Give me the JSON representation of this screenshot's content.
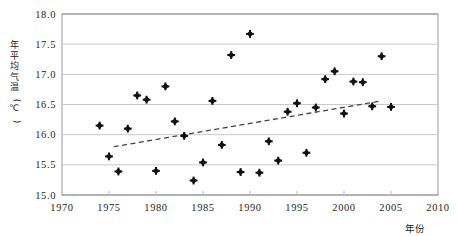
{
  "chart_data": {
    "type": "scatter",
    "title": "",
    "xlabel": "年份",
    "ylabel": "年平均气温(℃)",
    "xlim": [
      1970,
      2010
    ],
    "ylim": [
      15.0,
      18.0
    ],
    "xticks": [
      "1970",
      "1975",
      "1980",
      "1985",
      "1990",
      "1995",
      "2000",
      "2005",
      "2010"
    ],
    "xtick_values": [
      1970,
      1975,
      1980,
      1985,
      1990,
      1995,
      2000,
      2005,
      2010
    ],
    "yticks": [
      "15.0",
      "15.5",
      "16.0",
      "16.5",
      "17.0",
      "17.5",
      "18.0"
    ],
    "ytick_values": [
      15.0,
      15.5,
      16.0,
      16.5,
      17.0,
      17.5,
      18.0
    ],
    "grid": "horizontal",
    "legend": "none",
    "marker": "filled-diamond",
    "marker_color": "#111111",
    "points": [
      {
        "x": 1974,
        "y": 16.15
      },
      {
        "x": 1975,
        "y": 15.64
      },
      {
        "x": 1976,
        "y": 15.39
      },
      {
        "x": 1977,
        "y": 16.1
      },
      {
        "x": 1978,
        "y": 16.65
      },
      {
        "x": 1979,
        "y": 16.58
      },
      {
        "x": 1980,
        "y": 15.4
      },
      {
        "x": 1981,
        "y": 16.8
      },
      {
        "x": 1982,
        "y": 16.22
      },
      {
        "x": 1983,
        "y": 15.98
      },
      {
        "x": 1984,
        "y": 15.24
      },
      {
        "x": 1985,
        "y": 15.54
      },
      {
        "x": 1986,
        "y": 16.56
      },
      {
        "x": 1987,
        "y": 15.83
      },
      {
        "x": 1988,
        "y": 17.32
      },
      {
        "x": 1989,
        "y": 15.38
      },
      {
        "x": 1990,
        "y": 17.67
      },
      {
        "x": 1991,
        "y": 15.37
      },
      {
        "x": 1992,
        "y": 15.89
      },
      {
        "x": 1993,
        "y": 15.57
      },
      {
        "x": 1994,
        "y": 16.38
      },
      {
        "x": 1995,
        "y": 16.52
      },
      {
        "x": 1996,
        "y": 15.7
      },
      {
        "x": 1997,
        "y": 16.45
      },
      {
        "x": 1998,
        "y": 16.92
      },
      {
        "x": 1999,
        "y": 17.05
      },
      {
        "x": 2000,
        "y": 16.35
      },
      {
        "x": 2001,
        "y": 16.88
      },
      {
        "x": 2002,
        "y": 16.87
      },
      {
        "x": 2003,
        "y": 16.47
      },
      {
        "x": 2004,
        "y": 17.3
      },
      {
        "x": 2005,
        "y": 16.46
      }
    ],
    "trendline": {
      "style": "dashed",
      "color": "#444444",
      "x_start": 1975.5,
      "y_start": 15.8,
      "x_end": 2004.0,
      "y_end": 16.56
    }
  }
}
